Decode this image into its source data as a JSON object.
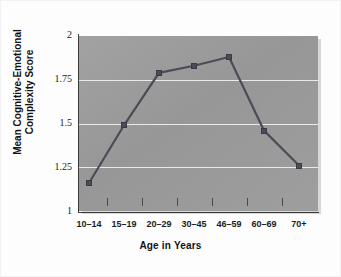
{
  "figure": {
    "background_color": "#fdfdfd",
    "plot_background_color": "#9b9b9b",
    "gridline_color": "#e9e9e9",
    "line_color": "#4c4c57",
    "marker_color": "#4c4c57",
    "axis_color": "#3b3b3b"
  },
  "chart_data": {
    "type": "line",
    "title": "",
    "xlabel": "Age in Years",
    "ylabel": "Mean Cognitive-Emotional Complexity Score",
    "ylabel_line1": "Mean Cognitive-Emotional",
    "ylabel_line2": "Complexity Score",
    "categories": [
      "10–14",
      "15–19",
      "20–29",
      "30–45",
      "46–59",
      "60–69",
      "70+"
    ],
    "values": [
      1.16,
      1.49,
      1.79,
      1.83,
      1.88,
      1.46,
      1.26
    ],
    "ylim": [
      1,
      2
    ],
    "yticks": [
      1,
      1.25,
      1.5,
      1.75,
      2
    ],
    "ytick_labels": [
      "1",
      "1.25",
      "1.5",
      "1.75",
      "2"
    ],
    "grid": true,
    "grid_axis": "y",
    "legend": false,
    "legend_position": "none",
    "markers": "square",
    "series": [
      {
        "name": "Mean Cognitive-Emotional Complexity Score",
        "values": [
          1.16,
          1.49,
          1.79,
          1.83,
          1.88,
          1.46,
          1.26
        ]
      }
    ]
  }
}
